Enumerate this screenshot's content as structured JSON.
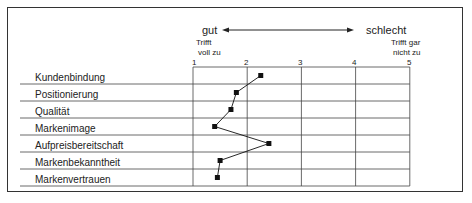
{
  "header": {
    "good_label": "gut",
    "bad_label": "schlecht",
    "left_anchor_line1": "Trifft",
    "left_anchor_line2": "voll zu",
    "right_anchor_line1": "Trifft gar",
    "right_anchor_line2": "nicht zu"
  },
  "scale": [
    "1",
    "2",
    "3",
    "4",
    "5"
  ],
  "rows": [
    "Kundenbindung",
    "Positionierung",
    "Qualität",
    "Markenimage",
    "Aufpreisbereitschaft",
    "Markenbekanntheit",
    "Markenvertrauen"
  ],
  "chart_data": {
    "type": "line",
    "title": "",
    "xlabel": "gut ← → schlecht (1 = Trifft voll zu, 5 = Trifft gar nicht zu)",
    "ylabel": "",
    "xlim": [
      1,
      5
    ],
    "x_ticks": [
      1,
      2,
      3,
      4,
      5
    ],
    "categories": [
      "Kundenbindung",
      "Positionierung",
      "Qualität",
      "Markenimage",
      "Aufpreisbereitschaft",
      "Markenbekanntheit",
      "Markenvertrauen"
    ],
    "values": [
      2.25,
      1.8,
      1.7,
      1.4,
      2.4,
      1.5,
      1.45
    ],
    "orientation": "horizontal profile",
    "grid": true,
    "legend": null,
    "marker": "square",
    "color": "#111111"
  }
}
